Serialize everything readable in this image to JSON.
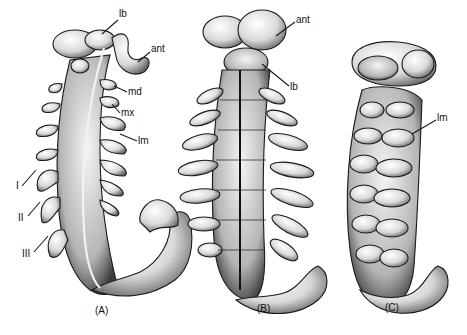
{
  "figure": {
    "panels": [
      {
        "id": "A",
        "caption": "(A)",
        "labels": [
          {
            "text": "lb",
            "x": 119,
            "y": 14
          },
          {
            "text": "ant",
            "x": 151,
            "y": 48
          },
          {
            "text": "md",
            "x": 128,
            "y": 89
          },
          {
            "text": "mx",
            "x": 121,
            "y": 110
          },
          {
            "text": "lm",
            "x": 138,
            "y": 138
          },
          {
            "text": "I",
            "x": 16,
            "y": 185
          },
          {
            "text": "II",
            "x": 20,
            "y": 217
          },
          {
            "text": "III",
            "x": 24,
            "y": 252
          }
        ]
      },
      {
        "id": "B",
        "caption": "(B)",
        "labels": [
          {
            "text": "ant",
            "x": 296,
            "y": 17
          },
          {
            "text": "lb",
            "x": 290,
            "y": 84
          }
        ]
      },
      {
        "id": "C",
        "caption": "(C)",
        "labels": [
          {
            "text": "lm",
            "x": 437,
            "y": 115
          }
        ]
      }
    ]
  }
}
